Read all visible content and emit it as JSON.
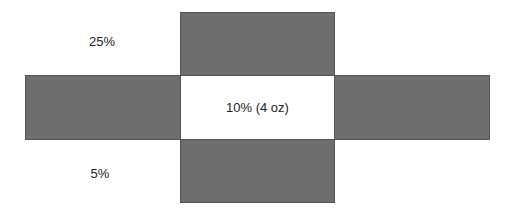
{
  "diagram": {
    "type": "cross-net",
    "colors": {
      "fill": "#6e6e6e",
      "border": "#555555",
      "background": "#ffffff",
      "text": "#222222"
    },
    "labels": {
      "top_left": "25%",
      "center": "10% (4 oz)",
      "bottom_left": "5%"
    },
    "blocks": [
      {
        "id": "top",
        "x": 180,
        "y": 12,
        "w": 154,
        "h": 63
      },
      {
        "id": "left",
        "x": 25,
        "y": 75,
        "w": 155,
        "h": 64
      },
      {
        "id": "center",
        "x": 180,
        "y": 75,
        "w": 154,
        "h": 64
      },
      {
        "id": "right",
        "x": 334,
        "y": 75,
        "w": 156,
        "h": 64
      },
      {
        "id": "bottom",
        "x": 180,
        "y": 139,
        "w": 154,
        "h": 64
      }
    ]
  }
}
